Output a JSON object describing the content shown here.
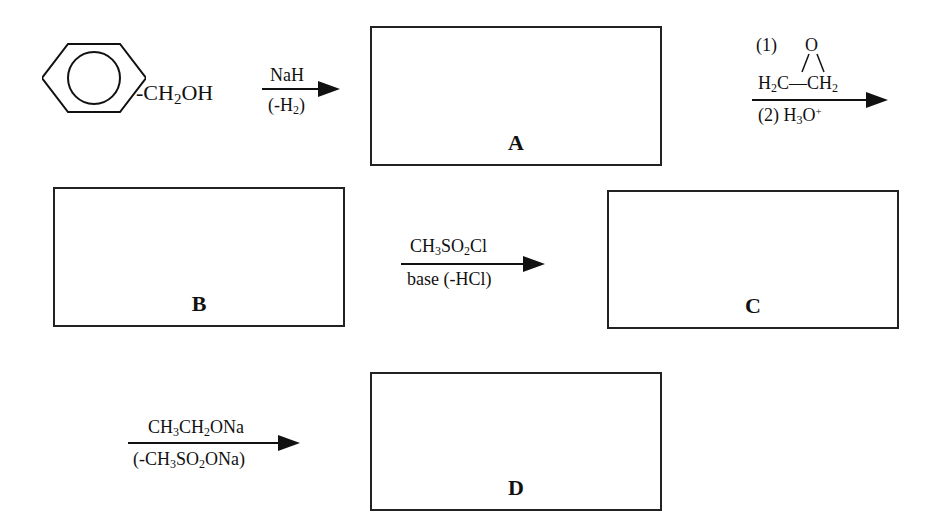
{
  "starting_material": {
    "ring": "benzene",
    "substituent": "CH2OH",
    "substituent_parts": [
      "-CH",
      "2",
      "OH"
    ]
  },
  "steps": [
    {
      "id": "step1",
      "reagent_above": [
        "NaH"
      ],
      "reagent_below": [
        "(-H",
        "2",
        ")"
      ],
      "product": "A"
    },
    {
      "id": "step2",
      "reagent_above": {
        "prefix": "(1)",
        "epoxide_o": "O",
        "left": [
          "H",
          "2",
          "C"
        ],
        "bond": "—",
        "right": [
          "CH",
          "2"
        ]
      },
      "reagent_below": {
        "text": "(2) H",
        "sub": "3",
        "base": "O",
        "sup": "+"
      },
      "product": "B"
    },
    {
      "id": "step3",
      "reagent_above": [
        "CH",
        "3",
        "SO",
        "2",
        "Cl"
      ],
      "reagent_below": "base (-HCl)",
      "product": "C"
    },
    {
      "id": "step4",
      "reagent_above": [
        "CH",
        "3",
        "CH",
        "2",
        "ONa"
      ],
      "reagent_below": [
        "(-CH",
        "3",
        "SO",
        "2",
        "ONa)"
      ],
      "product": "D"
    }
  ],
  "boxes": {
    "A": {
      "label": "A"
    },
    "B": {
      "label": "B"
    },
    "C": {
      "label": "C"
    },
    "D": {
      "label": "D"
    }
  },
  "colors": {
    "ink": "#111111",
    "background": "#ffffff"
  }
}
